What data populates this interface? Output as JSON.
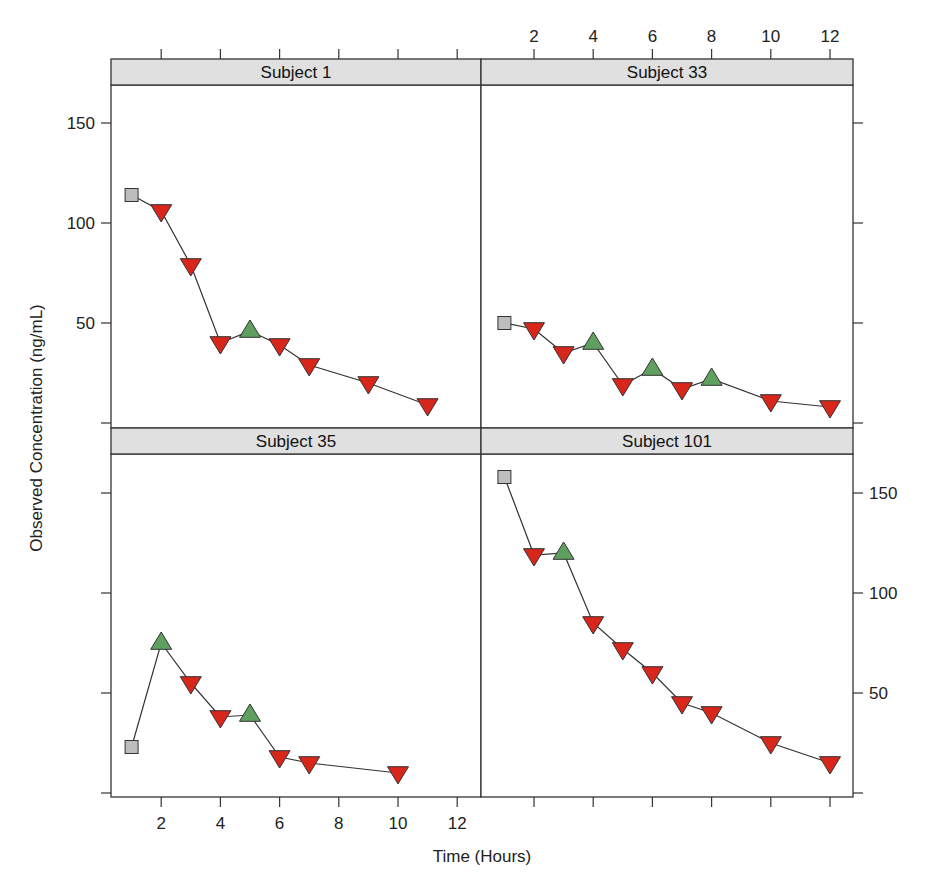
{
  "chart_data": {
    "type": "line",
    "layout": "lattice 2x2 (xyplot) with shared axes",
    "xlabel": "Time (Hours)",
    "ylabel": "Observed Concentration (ng/mL)",
    "xlim": [
      0.3,
      12.8
    ],
    "ylim": [
      -2,
      170
    ],
    "x_ticks": [
      2,
      4,
      6,
      8,
      10,
      12
    ],
    "y_ticks": [
      0,
      50,
      100,
      150
    ],
    "y_tick_labels": [
      "",
      "50",
      "100",
      "150"
    ],
    "grid": false,
    "legend": null,
    "marker_legend": {
      "square": {
        "meaning": "first observation",
        "color": "#bdbdbd"
      },
      "triangle_up": {
        "meaning": "increase from previous",
        "color": "#5fa060"
      },
      "triangle_down": {
        "meaning": "decrease from previous",
        "color": "#d8261a"
      }
    },
    "panels": [
      {
        "title": "Subject 1",
        "position": "top-left",
        "x": [
          1,
          2,
          3,
          4,
          5,
          6,
          7,
          9,
          11
        ],
        "y": [
          114,
          106,
          79,
          40,
          46,
          39,
          29,
          20,
          9
        ],
        "markers": [
          "square",
          "down",
          "down",
          "down",
          "up",
          "down",
          "down",
          "down",
          "down"
        ]
      },
      {
        "title": "Subject 33",
        "position": "top-right",
        "x": [
          1,
          2,
          3,
          4,
          5,
          6,
          7,
          8,
          10,
          12
        ],
        "y": [
          50,
          47,
          35,
          40,
          19,
          27,
          17,
          22,
          11,
          8
        ],
        "markers": [
          "square",
          "down",
          "down",
          "up",
          "down",
          "up",
          "down",
          "up",
          "down",
          "down"
        ]
      },
      {
        "title": "Subject 35",
        "position": "bottom-left",
        "x": [
          1,
          2,
          3,
          4,
          5,
          6,
          7,
          10
        ],
        "y": [
          23,
          75,
          55,
          38,
          39,
          18,
          15,
          10
        ],
        "markers": [
          "square",
          "up",
          "down",
          "down",
          "up",
          "down",
          "down",
          "down"
        ]
      },
      {
        "title": "Subject 101",
        "position": "bottom-right",
        "x": [
          1,
          2,
          3,
          4,
          5,
          6,
          7,
          8,
          10,
          12
        ],
        "y": [
          158,
          119,
          120,
          85,
          72,
          60,
          45,
          40,
          25,
          15
        ],
        "markers": [
          "square",
          "down",
          "up",
          "down",
          "down",
          "down",
          "down",
          "down",
          "down",
          "down"
        ]
      }
    ],
    "axis_placement": {
      "x_labels_top": "top-right panel",
      "x_labels_bottom": "bottom-left panel",
      "y_labels_left": "top-left panel",
      "y_labels_right": "bottom-right panel"
    }
  },
  "colors": {
    "strip_bg": "#e0e0e0",
    "frame": "#333333",
    "line": "#333333",
    "first_point": "#bdbdbd",
    "increase": "#5fa060",
    "decrease": "#d8261a"
  }
}
